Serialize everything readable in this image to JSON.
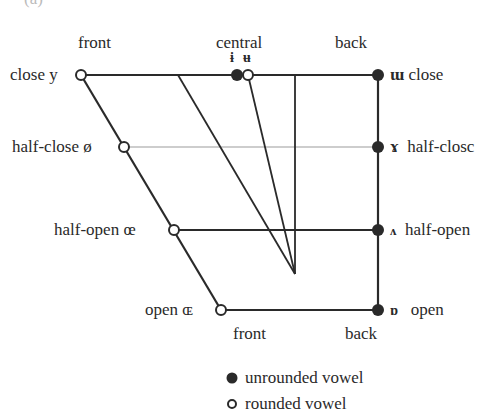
{
  "figure": {
    "panel_label": "(a)",
    "column_labels_top": {
      "front": "front",
      "central": "central",
      "back": "back"
    },
    "column_labels_bottom": {
      "front": "front",
      "back": "back"
    },
    "rows": [
      {
        "height": "close",
        "front_symbol": "y",
        "back_symbol": "ɯ",
        "left_label": "close",
        "right_label": "close"
      },
      {
        "height": "half-close",
        "front_symbol": "ø",
        "back_symbol": "ɤ",
        "left_label": "half-close",
        "right_label": "half-closc"
      },
      {
        "height": "half-open",
        "front_symbol": "œ",
        "back_symbol": "ʌ",
        "left_label": "half-open",
        "right_label": "half-open"
      },
      {
        "height": "open",
        "front_symbol": "ɶ",
        "back_symbol": "ɒ",
        "left_label": "open",
        "right_label": "open"
      }
    ],
    "central_symbols": {
      "unrounded": "ɨ",
      "rounded": "ʉ"
    },
    "legend": [
      {
        "marker": "filled",
        "label": "unrounded vowel"
      },
      {
        "marker": "open",
        "label": "rounded vowel"
      }
    ],
    "colors": {
      "ink": "#2a2a2a",
      "guide": "#bdbdbd",
      "background": "#ffffff"
    }
  }
}
